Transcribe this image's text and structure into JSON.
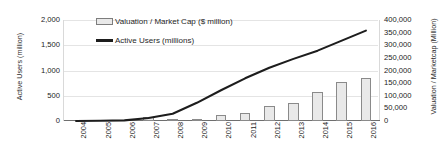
{
  "chart_data": {
    "type": "bar",
    "title": "",
    "xlabel": "",
    "categories": [
      "2004",
      "2005",
      "2006",
      "2007",
      "2008",
      "2009",
      "2010",
      "2011",
      "2012",
      "2013",
      "2014",
      "2015",
      "2016"
    ],
    "grid": true,
    "legend_position": "top-left",
    "series": [
      {
        "name": "Valuation / Market Cap ($ million)",
        "type": "bar",
        "axis": "right",
        "ylabel": "Valuation / Marketcap (Million)",
        "ylim": [
          0,
          400000
        ],
        "yticks": [
          0,
          50000,
          100000,
          150000,
          200000,
          250000,
          300000,
          350000,
          400000
        ],
        "ytick_labels": [
          "0",
          "50,000",
          "100,000",
          "150,000",
          "200,000",
          "250,000",
          "300,000",
          "350,000",
          "400,000"
        ],
        "color": "#e9e9e9",
        "edge_color": "#8a8a8a",
        "values": [
          0,
          0,
          0,
          15000,
          9000,
          5000,
          25000,
          30000,
          58000,
          72000,
          115000,
          153000,
          170000
        ]
      },
      {
        "name": "Active Users (millions)",
        "type": "line",
        "axis": "left",
        "ylabel": "Active Users (million)",
        "ylim": [
          0,
          2000
        ],
        "yticks": [
          0,
          500,
          1000,
          1500,
          2000
        ],
        "ytick_labels": [
          "0",
          "500",
          "1,000",
          "1,500",
          "2,000"
        ],
        "color": "#1d1d1d",
        "values": [
          1,
          6,
          12,
          58,
          145,
          360,
          608,
          845,
          1056,
          1230,
          1393,
          1591,
          1790
        ]
      }
    ]
  },
  "legend": {
    "items": [
      {
        "label": "Valuation / Market Cap ($ million)",
        "marker": "bar-swatch"
      },
      {
        "label": "Active Users (millions)",
        "marker": "line-swatch"
      }
    ]
  }
}
